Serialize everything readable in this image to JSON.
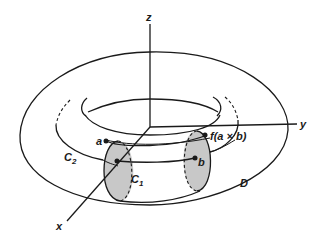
{
  "diagram": {
    "type": "torus-with-cross-sections",
    "axes": {
      "z_label": "z",
      "y_label": "y",
      "x_label": "x"
    },
    "points": {
      "a": "a",
      "b": "b",
      "f_label": "f(a × b)"
    },
    "curves": {
      "c1_main": "C",
      "c1_sub": "1",
      "c2_main": "C",
      "c2_sub": "2",
      "d_label": "D"
    },
    "colors": {
      "line": "#1a1a1a",
      "section_fill": "#c8c8c8",
      "background": "#ffffff"
    }
  }
}
